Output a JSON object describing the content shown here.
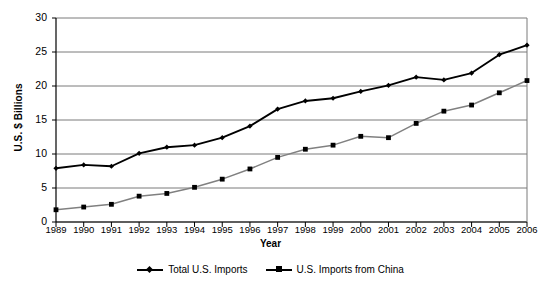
{
  "chart_data": {
    "type": "line",
    "title": "",
    "xlabel": "Year",
    "ylabel": "U.S. $ Billions",
    "categories": [
      "1989",
      "1990",
      "1991",
      "1992",
      "1993",
      "1994",
      "1995",
      "1996",
      "1997",
      "1998",
      "1999",
      "2000",
      "2001",
      "2002",
      "2003",
      "2004",
      "2005",
      "2006"
    ],
    "x": [
      1989,
      1990,
      1991,
      1992,
      1993,
      1994,
      1995,
      1996,
      1997,
      1998,
      1999,
      2000,
      2001,
      2002,
      2003,
      2004,
      2005,
      2006
    ],
    "ylim": [
      0,
      30
    ],
    "yticks": [
      0,
      5,
      10,
      15,
      20,
      25,
      30
    ],
    "ytick_labels": [
      "0",
      "5",
      "10",
      "15",
      "20",
      "25",
      "30"
    ],
    "grid": true,
    "grid_axis": "y",
    "legend_position": "bottom-center",
    "series": [
      {
        "name": "Total U.S. Imports",
        "marker": "diamond",
        "color": "#000000",
        "values": [
          7.9,
          8.4,
          8.2,
          10.1,
          11.0,
          11.3,
          12.4,
          14.1,
          16.6,
          17.8,
          18.2,
          19.2,
          20.1,
          21.3,
          20.9,
          21.9,
          24.6,
          26.0
        ]
      },
      {
        "name": "U.S. Imports from China",
        "marker": "square",
        "color": "#808080",
        "values": [
          1.8,
          2.2,
          2.6,
          3.8,
          4.2,
          5.1,
          6.3,
          7.8,
          9.5,
          10.7,
          11.3,
          12.6,
          12.4,
          14.5,
          16.3,
          17.2,
          19.0,
          20.8
        ]
      }
    ]
  },
  "legend": {
    "entries": [
      {
        "label": "Total U.S. Imports",
        "marker": "diamond-marker"
      },
      {
        "label": "U.S. Imports from China",
        "marker": "square-marker"
      }
    ]
  },
  "axes": {
    "y_title": "U.S. $ Billions",
    "x_title": "Year"
  }
}
